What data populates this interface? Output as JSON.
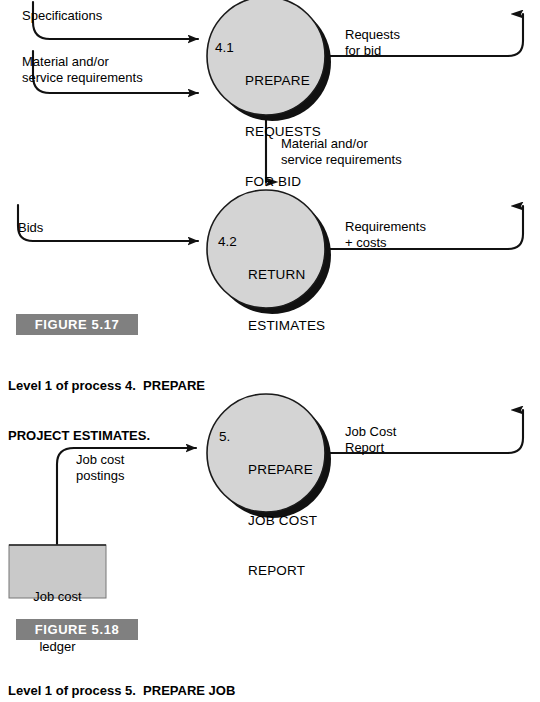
{
  "page": {
    "width": 540,
    "height": 671,
    "background": "#ffffff",
    "ink": "#000000",
    "process_fill": "#d4d4d4",
    "process_stroke": "#1a1a1a",
    "shadow_color": "#111111",
    "store_fill": "#c9c9c9",
    "store_stroke": "#555555",
    "figure_band_fill": "#808080",
    "figure_band_text": "#ffffff"
  },
  "diagram_1": {
    "name": "Level 1 of process 4 — PREPARE PROJECT ESTIMATES",
    "processes": [
      {
        "id": "4.1",
        "number": "4.1",
        "lines": [
          "PREPARE",
          "REQUESTS",
          "FOR BID"
        ],
        "full_label": "4.1  PREPARE REQUESTS FOR BID"
      },
      {
        "id": "4.2",
        "number": "4.2",
        "lines": [
          "RETURN",
          "ESTIMATES"
        ],
        "full_label": "4.2  RETURN ESTIMATES"
      }
    ],
    "flows": [
      {
        "id": "specifications",
        "lines": [
          "Specifications"
        ]
      },
      {
        "id": "material-service-in",
        "lines": [
          "Material and/or",
          "service requirements"
        ]
      },
      {
        "id": "requests-for-bid",
        "lines": [
          "Requests",
          "for bid"
        ]
      },
      {
        "id": "material-service-mid",
        "lines": [
          "Material and/or",
          "service requirements"
        ]
      },
      {
        "id": "bids",
        "lines": [
          "Bids"
        ]
      },
      {
        "id": "requirements-costs",
        "lines": [
          "Requirements",
          "+ costs"
        ]
      }
    ]
  },
  "diagram_2": {
    "name": "Level 1 of process 5 — PREPARE JOB COST REPORT",
    "processes": [
      {
        "id": "5",
        "number": "5.",
        "lines": [
          "PREPARE",
          "JOB COST",
          "REPORT"
        ],
        "full_label": "5.  PREPARE JOB COST REPORT"
      }
    ],
    "flows": [
      {
        "id": "job-cost-postings",
        "lines": [
          "Job cost",
          "postings"
        ]
      },
      {
        "id": "job-cost-report",
        "lines": [
          "Job Cost",
          "Report"
        ]
      }
    ],
    "data_stores": [
      {
        "id": "job-cost-ledger",
        "lines": [
          "Job cost",
          "ledger"
        ]
      }
    ]
  },
  "figures": [
    {
      "id": "figure-5-17",
      "band_label": "FIGURE 5.17",
      "caption_lines": [
        "Level 1 of process 4.  PREPARE",
        "PROJECT ESTIMATES."
      ]
    },
    {
      "id": "figure-5-18",
      "band_label": "FIGURE 5.18",
      "caption_lines": [
        "Level 1 of process 5.  PREPARE JOB"
      ]
    }
  ]
}
